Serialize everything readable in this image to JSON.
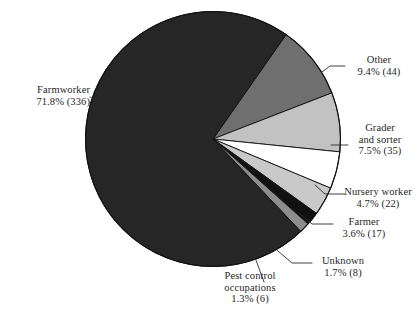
{
  "chart_data": {
    "type": "pie",
    "title": "",
    "subtitle": "",
    "xlabel": "",
    "ylabel": "",
    "legend_position": "none",
    "grid": false,
    "total": 468,
    "value_unit": "count",
    "categories": [
      "Farmworker",
      "Other",
      "Grader and sorter",
      "Nursery worker",
      "Farmer",
      "Unknown",
      "Pest control occupations"
    ],
    "values": [
      336,
      44,
      35,
      22,
      17,
      8,
      6
    ],
    "percents": [
      71.8,
      9.4,
      7.5,
      4.7,
      3.6,
      1.7,
      1.3
    ],
    "slices": [
      {
        "name": "Other",
        "lines": [
          "Other"
        ],
        "value_text": "9.4% (44)",
        "percent": 9.4,
        "count": 44,
        "color": "#6f6f6f",
        "start_deg": -55.0,
        "end_deg": -21.2
      },
      {
        "name": "Grader and sorter",
        "lines": [
          "Grader",
          "and sorter"
        ],
        "value_text": "7.5% (35)",
        "percent": 7.5,
        "count": 35,
        "color": "#c2c2c2",
        "start_deg": -21.2,
        "end_deg": 5.8
      },
      {
        "name": "Nursery worker",
        "lines": [
          "Nursery worker"
        ],
        "value_text": "4.7%  (22)",
        "percent": 4.7,
        "count": 22,
        "color": "#ffffff",
        "start_deg": 5.8,
        "end_deg": 22.7
      },
      {
        "name": "Farmer",
        "lines": [
          "Farmer"
        ],
        "value_text": "3.6% (17)",
        "percent": 3.6,
        "count": 17,
        "color": "#c9c9c9",
        "start_deg": 22.7,
        "end_deg": 35.7
      },
      {
        "name": "Unknown",
        "lines": [
          "Unknown"
        ],
        "value_text": "1.7% (8)",
        "percent": 1.7,
        "count": 8,
        "color": "#111111",
        "start_deg": 35.7,
        "end_deg": 41.8
      },
      {
        "name": "Pest control occupations",
        "lines": [
          "Pest control",
          "occupations"
        ],
        "value_text": "1.3% (6)",
        "percent": 1.3,
        "count": 6,
        "color": "#8d8d8d",
        "start_deg": 41.8,
        "end_deg": 46.5
      },
      {
        "name": "Farmworker",
        "lines": [
          "Farmworker"
        ],
        "value_text": "71.8%  (336)",
        "percent": 71.8,
        "count": 336,
        "color": "#262626",
        "start_deg": 46.5,
        "end_deg": 305.0
      }
    ],
    "labels": {
      "farmworker": {
        "line1": "Farmworker",
        "line2": "71.8%  (336)"
      },
      "other": {
        "line1": "Other",
        "line2": "9.4% (44)"
      },
      "grader_and_sorter": {
        "line1": "Grader",
        "line2": "and sorter",
        "line3": "7.5% (35)"
      },
      "nursery_worker": {
        "line1": "Nursery worker",
        "line2": "4.7%  (22)"
      },
      "farmer": {
        "line1": "Farmer",
        "line2": "3.6% (17)"
      },
      "unknown": {
        "line1": "Unknown",
        "line2": "1.7% (8)"
      },
      "pest_control": {
        "line1": "Pest control",
        "line2": "occupations",
        "line3": "1.3% (6)"
      }
    }
  },
  "colors": {
    "background": "#ffffff",
    "text": "#1f1f1f",
    "outline": "#111111",
    "leader_line": "#2a2a2a"
  }
}
